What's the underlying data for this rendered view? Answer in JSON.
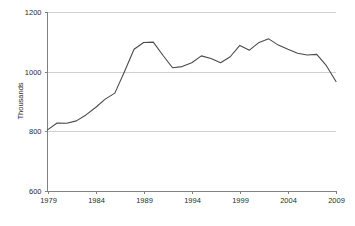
{
  "chart_data": {
    "type": "line",
    "title": "",
    "xlabel": "",
    "ylabel": "Thousands",
    "xlim": [
      1979,
      2009
    ],
    "ylim": [
      600,
      1200
    ],
    "grid": true,
    "legend": false,
    "x_ticks": [
      "1979",
      "1984",
      "1989",
      "1994",
      "1999",
      "2004",
      "2009"
    ],
    "x_tick_values": [
      1979,
      1984,
      1989,
      1994,
      1999,
      2004,
      2009
    ],
    "y_ticks": [
      "600",
      "800",
      "1000",
      "1200"
    ],
    "y_tick_values": [
      600,
      800,
      1000,
      1200
    ],
    "gridline_values": [
      800,
      1000,
      1200
    ],
    "line_color": "#4a4a4a",
    "axis_color": "#808080",
    "grid_color": "#d0d0d0",
    "x": [
      1979,
      1980,
      1981,
      1982,
      1983,
      1984,
      1985,
      1986,
      1987,
      1988,
      1989,
      1990,
      1991,
      1992,
      1993,
      1994,
      1995,
      1996,
      1997,
      1998,
      1999,
      2000,
      2001,
      2002,
      2003,
      2004,
      2005,
      2006,
      2007,
      2008,
      2009
    ],
    "values": [
      805,
      828,
      827,
      835,
      855,
      880,
      908,
      928,
      1000,
      1075,
      1098,
      1099,
      1055,
      1013,
      1017,
      1030,
      1053,
      1044,
      1030,
      1050,
      1088,
      1072,
      1098,
      1110,
      1089,
      1075,
      1062,
      1056,
      1058,
      1020,
      967
    ],
    "series": [
      {
        "name": "",
        "values": [
          805,
          828,
          827,
          835,
          855,
          880,
          908,
          928,
          1000,
          1075,
          1098,
          1099,
          1055,
          1013,
          1017,
          1030,
          1053,
          1044,
          1030,
          1050,
          1088,
          1072,
          1098,
          1110,
          1089,
          1075,
          1062,
          1056,
          1058,
          1020,
          967
        ]
      }
    ]
  }
}
